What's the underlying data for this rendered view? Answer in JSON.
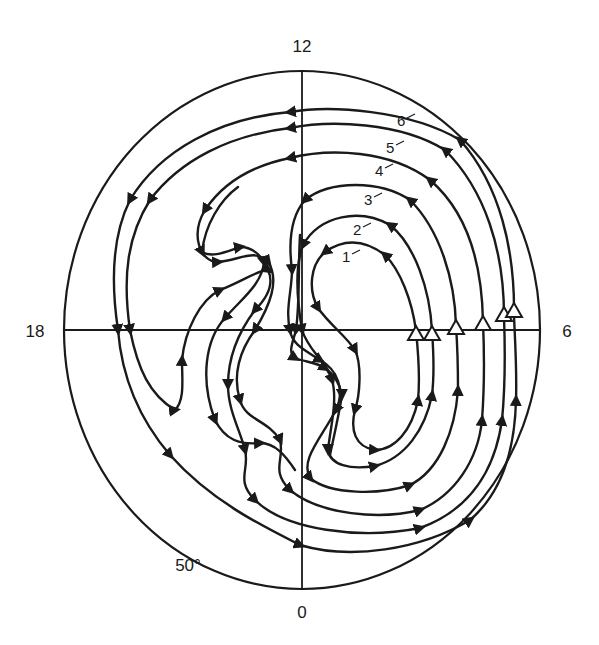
{
  "diagram": {
    "type": "polar convection trajectory plot",
    "colors": {
      "ink": "#1a1a1a",
      "background": "#ffffff"
    },
    "axis_labels": {
      "top": "12",
      "bottom": "0",
      "left": "18",
      "right": "6"
    },
    "latitude_label": "50°",
    "trajectory_labels": [
      "1",
      "2",
      "3",
      "4",
      "5",
      "6"
    ],
    "start_marker": "open-triangle",
    "direction_marker": "filled-arrowhead"
  }
}
